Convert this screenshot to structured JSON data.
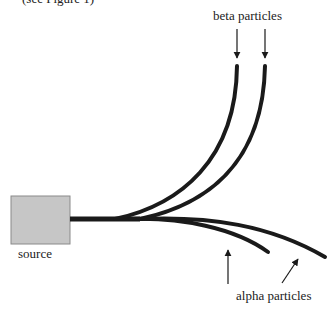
{
  "caption_top": "(see Figure 1)",
  "labels": {
    "beta": "beta particles",
    "source": "source",
    "alpha": "alpha particles"
  },
  "colors": {
    "track": "#1a1a1a",
    "source_fill": "#c6c6c6",
    "source_border": "#8a8a8a"
  }
}
